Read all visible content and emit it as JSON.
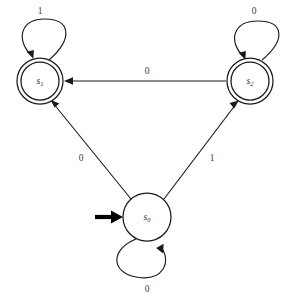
{
  "diagram": {
    "type": "finite-state-machine",
    "title": "",
    "alphabet": [
      "0",
      "1"
    ],
    "states": [
      {
        "id": "s1",
        "label": "s",
        "subscript": "1",
        "role": "accepting",
        "accepting": true,
        "start": false,
        "cx": 40,
        "cy": 81,
        "r_outer": 23,
        "r_inner": 19
      },
      {
        "id": "s2",
        "label": "s",
        "subscript": "2",
        "role": "accepting",
        "accepting": true,
        "start": false,
        "cx": 250,
        "cy": 81,
        "r_outer": 23,
        "r_inner": 19
      },
      {
        "id": "s0",
        "label": "s",
        "subscript": "0",
        "role": "start",
        "accepting": false,
        "start": true,
        "cx": 147,
        "cy": 217,
        "r_outer": 24,
        "r_inner": 0
      }
    ],
    "transitions": [
      {
        "id": "t-s1-self",
        "from": "s1",
        "to": "s1",
        "symbol": "1",
        "kind": "self-loop",
        "loop_side": "top",
        "label_x": 40,
        "label_y": 12
      },
      {
        "id": "t-s2-self",
        "from": "s2",
        "to": "s2",
        "symbol": "0",
        "kind": "self-loop",
        "loop_side": "top",
        "label_x": 254,
        "label_y": 12
      },
      {
        "id": "t-s0-self",
        "from": "s0",
        "to": "s0",
        "symbol": "0",
        "kind": "self-loop",
        "loop_side": "bottom",
        "label_x": 147,
        "label_y": 290
      },
      {
        "id": "t-s2-s1",
        "from": "s2",
        "to": "s1",
        "symbol": "0",
        "kind": "straight",
        "label_x": 147,
        "label_y": 72
      },
      {
        "id": "t-s0-s1",
        "from": "s0",
        "to": "s1",
        "symbol": "0",
        "kind": "straight",
        "label_x": 81,
        "label_y": 159
      },
      {
        "id": "t-s0-s2",
        "from": "s0",
        "to": "s2",
        "symbol": "1",
        "kind": "straight",
        "label_x": 212,
        "label_y": 159
      }
    ],
    "start_marker": {
      "id": "start-arrow",
      "target": "s0",
      "label": ""
    }
  }
}
